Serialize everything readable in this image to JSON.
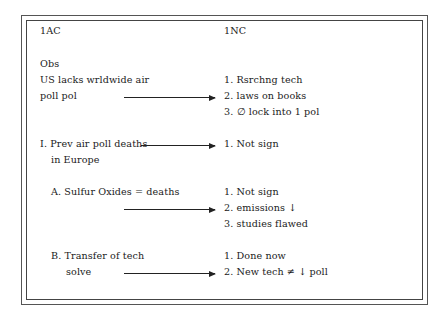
{
  "flow": {
    "columns": [
      {
        "id": "1ac",
        "label": "1AC"
      },
      {
        "id": "1nc",
        "label": "1NC"
      }
    ],
    "aff": {
      "obs_heading": "Obs",
      "obs_line1": "US lacks wrldwide air",
      "obs_line2": "poll pol",
      "adv1_line1": "I. Prev air poll deaths",
      "adv1_line2": "in Europe",
      "subA": "A. Sulfur Oxides = deaths",
      "subB_line1": "B. Transfer of tech",
      "subB_line2": "solve"
    },
    "neg": {
      "obs_responses": [
        "1. Rsrchng tech",
        "2. laws on books",
        "3. ∅ lock into 1 pol"
      ],
      "adv1_responses": [
        "1. Not sign"
      ],
      "subA_responses": [
        "1. Not sign",
        "2. emissions ↓",
        "3. studies flawed"
      ],
      "subB_responses": [
        "1. Done now",
        "2. New tech ≠ ↓ poll"
      ]
    },
    "arrows": [
      {
        "from": "poll pol",
        "to": "2. laws on books"
      },
      {
        "from": "I. Prev air poll deaths",
        "to": "1. Not sign"
      },
      {
        "from": "A. Sulfur Oxides = deaths",
        "to": "2. emissions ↓"
      },
      {
        "from": "solve",
        "to": "2. New tech ≠ ↓ poll"
      }
    ]
  }
}
